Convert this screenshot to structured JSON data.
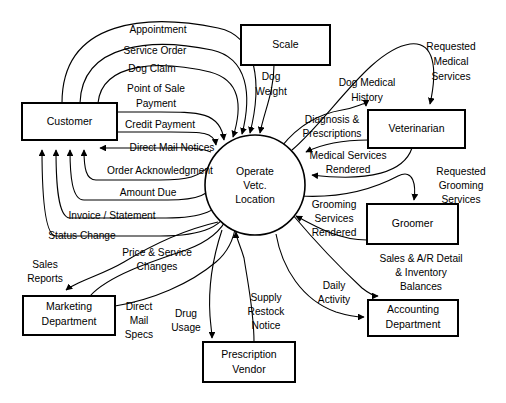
{
  "diagram": {
    "type": "data-flow-diagram",
    "colors": {
      "background": "#ffffff",
      "stroke": "#000000",
      "fill": "#ffffff"
    },
    "process": {
      "id": "operate-vetc-location",
      "shape": "circle",
      "cx": 255,
      "cy": 185,
      "r": 50,
      "lines": [
        "Operate",
        "Vetc.",
        "Location"
      ]
    },
    "entities": [
      {
        "id": "customer",
        "lines": [
          "Customer"
        ],
        "x": 22,
        "y": 103,
        "w": 95,
        "h": 37
      },
      {
        "id": "scale",
        "lines": [
          "Scale"
        ],
        "x": 241,
        "y": 25,
        "w": 89,
        "h": 40
      },
      {
        "id": "veterinarian",
        "lines": [
          "Veterinarian"
        ],
        "x": 368,
        "y": 110,
        "w": 97,
        "h": 38
      },
      {
        "id": "groomer",
        "lines": [
          "Groomer"
        ],
        "x": 367,
        "y": 204,
        "w": 91,
        "h": 40
      },
      {
        "id": "accounting-department",
        "lines": [
          "Accounting",
          "Department"
        ],
        "x": 368,
        "y": 300,
        "w": 90,
        "h": 36
      },
      {
        "id": "marketing-department",
        "lines": [
          "Marketing",
          "Department"
        ],
        "x": 23,
        "y": 296,
        "w": 92,
        "h": 39
      },
      {
        "id": "prescription-vendor",
        "lines": [
          "Prescription",
          "Vendor"
        ],
        "x": 203,
        "y": 342,
        "w": 92,
        "h": 40
      }
    ],
    "flows": [
      {
        "id": "appointment",
        "lines": [
          "Appointment"
        ],
        "from": "customer",
        "to": "operate-vetc-location"
      },
      {
        "id": "service-order",
        "lines": [
          "Service Order"
        ],
        "from": "customer",
        "to": "operate-vetc-location"
      },
      {
        "id": "dog-claim",
        "lines": [
          "Dog Claim"
        ],
        "from": "customer",
        "to": "operate-vetc-location"
      },
      {
        "id": "point-of-sale-payment",
        "lines": [
          "Point of Sale",
          "Payment"
        ],
        "from": "customer",
        "to": "operate-vetc-location"
      },
      {
        "id": "credit-payment",
        "lines": [
          "Credit Payment"
        ],
        "from": "customer",
        "to": "operate-vetc-location"
      },
      {
        "id": "direct-mail-notices",
        "lines": [
          "Direct Mail Notices"
        ],
        "from": "operate-vetc-location",
        "to": "customer"
      },
      {
        "id": "order-acknowledgment",
        "lines": [
          "Order Acknowledgment"
        ],
        "from": "operate-vetc-location",
        "to": "customer"
      },
      {
        "id": "amount-due",
        "lines": [
          "Amount Due"
        ],
        "from": "operate-vetc-location",
        "to": "customer"
      },
      {
        "id": "invoice-statement",
        "lines": [
          "Invoice / Statement"
        ],
        "from": "operate-vetc-location",
        "to": "customer"
      },
      {
        "id": "status-change",
        "lines": [
          "Status Change"
        ],
        "from": "operate-vetc-location",
        "to": "customer"
      },
      {
        "id": "dog-weight",
        "lines": [
          "Dog",
          "Weight"
        ],
        "from": "scale",
        "to": "operate-vetc-location"
      },
      {
        "id": "dog-medical-history",
        "lines": [
          "Dog Medical",
          "History"
        ],
        "from": "operate-vetc-location",
        "to": "veterinarian"
      },
      {
        "id": "requested-medical-services",
        "lines": [
          "Requested",
          "Medical",
          "Services"
        ],
        "from": "operate-vetc-location",
        "to": "veterinarian"
      },
      {
        "id": "diagnosis-prescriptions",
        "lines": [
          "Diagnosis &",
          "Prescriptions"
        ],
        "from": "veterinarian",
        "to": "operate-vetc-location"
      },
      {
        "id": "medical-services-rendered",
        "lines": [
          "Medical Services",
          "Rendered"
        ],
        "from": "veterinarian",
        "to": "operate-vetc-location"
      },
      {
        "id": "requested-grooming-services",
        "lines": [
          "Requested",
          "Grooming",
          "Services"
        ],
        "from": "operate-vetc-location",
        "to": "groomer"
      },
      {
        "id": "grooming-services-rendered",
        "lines": [
          "Grooming",
          "Services",
          "Rendered"
        ],
        "from": "groomer",
        "to": "operate-vetc-location"
      },
      {
        "id": "sales-ar-detail-inventory",
        "lines": [
          "Sales & A/R Detail",
          "& Inventory",
          "Balances"
        ],
        "from": "operate-vetc-location",
        "to": "accounting-department"
      },
      {
        "id": "daily-activity",
        "lines": [
          "Daily",
          "Activity"
        ],
        "from": "operate-vetc-location",
        "to": "accounting-department"
      },
      {
        "id": "supply-restock-notice",
        "lines": [
          "Supply",
          "Restock",
          "Notice"
        ],
        "from": "prescription-vendor",
        "to": "operate-vetc-location"
      },
      {
        "id": "drug-usage",
        "lines": [
          "Drug",
          "Usage"
        ],
        "from": "operate-vetc-location",
        "to": "prescription-vendor"
      },
      {
        "id": "sales-reports",
        "lines": [
          "Sales",
          "Reports"
        ],
        "from": "operate-vetc-location",
        "to": "marketing-department"
      },
      {
        "id": "price-service-changes",
        "lines": [
          "Price & Service",
          "Changes"
        ],
        "from": "marketing-department",
        "to": "operate-vetc-location"
      },
      {
        "id": "direct-mail-specs",
        "lines": [
          "Direct",
          "Mail",
          "Specs"
        ],
        "from": "marketing-department",
        "to": "operate-vetc-location"
      }
    ]
  }
}
